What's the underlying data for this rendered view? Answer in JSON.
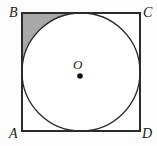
{
  "figure": {
    "type": "geometry-diagram",
    "canvas": {
      "width": 157,
      "height": 146
    },
    "background_color": "#fdfdfd",
    "stroke_color": "#2b2b2b",
    "shaded_color": "#a8a8a8",
    "interior_color": "#ffffff"
  },
  "square": {
    "name": "ABCD",
    "x": 22,
    "y": 13,
    "width": 118,
    "height": 118,
    "stroke_width": 1.4,
    "vertices": [
      {
        "id": "B",
        "label": "B",
        "position": "top-left",
        "x": 22,
        "y": 13
      },
      {
        "id": "C",
        "label": "C",
        "position": "top-right",
        "x": 140,
        "y": 13
      },
      {
        "id": "A",
        "label": "A",
        "position": "bottom-left",
        "x": 22,
        "y": 131
      },
      {
        "id": "D",
        "label": "D",
        "position": "bottom-right",
        "x": 140,
        "y": 131
      }
    ]
  },
  "circle": {
    "label": "inscribed circle",
    "center": {
      "label": "O",
      "x": 81,
      "y": 72
    },
    "radius": 59,
    "stroke_width": 1.3,
    "fill": "#ffffff"
  },
  "center_point": {
    "label": "O",
    "dot_x": 80,
    "dot_y": 76,
    "dot_radius": 2.8,
    "dot_color": "#111111"
  },
  "shaded_region": {
    "description": "corner region between square vertex B and the circle arc",
    "corner": "B",
    "fill": "#a8a8a8"
  },
  "chart_data": {
    "type": "diagram",
    "labels": [
      "A",
      "B",
      "C",
      "D",
      "O"
    ],
    "annotations": [
      "B is the top-left vertex of the square",
      "C is the top-right vertex of the square",
      "A is the bottom-left vertex of the square",
      "D is the bottom-right vertex of the square",
      "O is the center of the inscribed circle",
      "The shaded grey region lies between corner B and the circle"
    ]
  }
}
